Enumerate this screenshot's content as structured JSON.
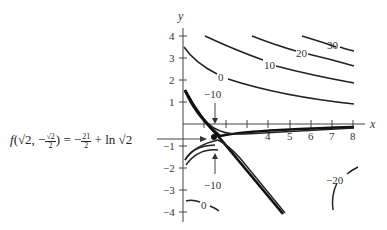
{
  "axes": {
    "x_label": "x",
    "y_label": "y",
    "x_ticks": [
      "4",
      "5",
      "6",
      "7",
      "8"
    ],
    "y_ticks": [
      "4",
      "3",
      "2",
      "1",
      "−1",
      "−2",
      "−3",
      "−4"
    ]
  },
  "contour_labels": {
    "c30": "30",
    "c20": "20",
    "c10": "10",
    "c0_upper": "0",
    "cm10_upper": "−10",
    "cm10_lower": "−10",
    "cm20": "−20",
    "c0_lower": "0"
  },
  "annotation": {
    "f": "f",
    "arg_open": "(√2, −",
    "frac1_num": "√2",
    "frac1_den": "2",
    "arg_close": ") = −",
    "frac2_num": "21",
    "frac2_den": "2",
    "tail": " + ln √2"
  },
  "colors": {
    "curve": "#222222",
    "axis": "#444444",
    "background": "#ffffff"
  }
}
